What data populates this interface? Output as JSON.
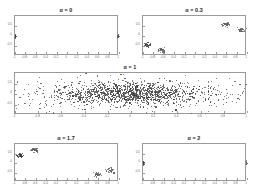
{
  "figure": {
    "background_color": "#ffffff",
    "axis_color": "#9a9a9a",
    "point_color": "#5e5e5e",
    "point_color_dark": "#3c3c3c",
    "title_color": "#1d1d1d"
  },
  "chart_data": [
    {
      "type": "scatter",
      "title": "α = 0",
      "xlabel": "",
      "ylabel": "",
      "xlim": [
        -1.0,
        1.0
      ],
      "ylim": [
        -1.0,
        1.0
      ],
      "grid": false,
      "legend": "none",
      "xticks": [
        -1.0,
        -0.8,
        -0.6,
        -0.4,
        -0.2,
        0.0,
        0.2,
        0.4,
        0.6,
        0.8,
        1.0
      ],
      "xticklabels": [
        "-1",
        "-0.8",
        "-0.6",
        "-0.4",
        "-0.2",
        "0",
        "0.2",
        "0.4",
        "0.6",
        "0.8",
        "1"
      ],
      "yticks": [
        -0.5,
        0.0,
        0.5
      ],
      "yticklabels": [
        "-0.5",
        "0",
        "0.5"
      ],
      "clusters": [
        {
          "cx": -1.0,
          "cy": 0.0,
          "n": 40,
          "sx": 0.012,
          "sy": 0.05
        },
        {
          "cx": 1.0,
          "cy": 0.0,
          "n": 40,
          "sx": 0.012,
          "sy": 0.05
        }
      ]
    },
    {
      "type": "scatter",
      "title": "α = 0.3",
      "xlabel": "",
      "ylabel": "",
      "xlim": [
        -1.0,
        1.0
      ],
      "ylim": [
        -1.0,
        1.0
      ],
      "grid": false,
      "legend": "none",
      "xticks": [
        -1.0,
        -0.8,
        -0.6,
        -0.4,
        -0.2,
        0.0,
        0.2,
        0.4,
        0.6,
        0.8,
        1.0
      ],
      "xticklabels": [
        "-1",
        "-0.8",
        "-0.6",
        "-0.4",
        "-0.2",
        "0",
        "0.2",
        "0.4",
        "0.6",
        "0.8",
        "1"
      ],
      "yticks": [
        -0.5,
        0.0,
        0.5
      ],
      "yticklabels": [
        "-0.5",
        "0",
        "0.5"
      ],
      "clusters": [
        {
          "cx": -0.92,
          "cy": -0.46,
          "n": 34,
          "sx": 0.035,
          "sy": 0.055
        },
        {
          "cx": -0.64,
          "cy": -0.72,
          "n": 34,
          "sx": 0.035,
          "sy": 0.055
        },
        {
          "cx": 0.6,
          "cy": 0.56,
          "n": 34,
          "sx": 0.035,
          "sy": 0.055
        },
        {
          "cx": 0.88,
          "cy": 0.3,
          "n": 34,
          "sx": 0.035,
          "sy": 0.055
        }
      ]
    },
    {
      "type": "scatter",
      "title": "α = 1",
      "xlabel": "",
      "ylabel": "",
      "xlim": [
        -1.0,
        1.0
      ],
      "ylim": [
        -1.0,
        1.0
      ],
      "grid": false,
      "legend": "none",
      "xticks": [
        -1.0,
        -0.8,
        -0.6,
        -0.4,
        -0.2,
        0.0,
        0.2,
        0.4,
        0.6,
        0.8,
        1.0
      ],
      "xticklabels": [
        "-1",
        "-0.8",
        "-0.6",
        "-0.4",
        "-0.2",
        "0",
        "0.2",
        "0.4",
        "0.6",
        "0.8",
        "1"
      ],
      "yticks": [
        -0.5,
        0.0,
        0.5
      ],
      "yticklabels": [
        "-0.5",
        "0",
        "0.5"
      ],
      "clusters": [
        {
          "cx": 0.0,
          "cy": 0.0,
          "n": 900,
          "sx": 0.3,
          "sy": 0.26
        },
        {
          "cx": 0.0,
          "cy": 0.0,
          "n": 420,
          "sx": 0.52,
          "sy": 0.36
        },
        {
          "cx": 0.0,
          "cy": 0.0,
          "n": 140,
          "sx": 0.78,
          "sy": 0.46
        }
      ]
    },
    {
      "type": "scatter",
      "title": "α = 1.7",
      "xlabel": "",
      "ylabel": "",
      "xlim": [
        -1.0,
        1.0
      ],
      "ylim": [
        -1.0,
        1.0
      ],
      "grid": false,
      "legend": "none",
      "xticks": [
        -1.0,
        -0.8,
        -0.6,
        -0.4,
        -0.2,
        0.0,
        0.2,
        0.4,
        0.6,
        0.8,
        1.0
      ],
      "xticklabels": [
        "-1",
        "-0.8",
        "-0.6",
        "-0.4",
        "-0.2",
        "0",
        "0.2",
        "0.4",
        "0.6",
        "0.8",
        "1"
      ],
      "yticks": [
        -0.5,
        0.0,
        0.5
      ],
      "yticklabels": [
        "-0.5",
        "0",
        "0.5"
      ],
      "clusters": [
        {
          "cx": -0.9,
          "cy": 0.4,
          "n": 34,
          "sx": 0.035,
          "sy": 0.055
        },
        {
          "cx": -0.62,
          "cy": 0.66,
          "n": 34,
          "sx": 0.035,
          "sy": 0.055
        },
        {
          "cx": 0.58,
          "cy": -0.62,
          "n": 34,
          "sx": 0.035,
          "sy": 0.055
        },
        {
          "cx": 0.84,
          "cy": -0.4,
          "n": 34,
          "sx": 0.035,
          "sy": 0.055
        }
      ]
    },
    {
      "type": "scatter",
      "title": "α = 2",
      "xlabel": "",
      "ylabel": "",
      "xlim": [
        -1.0,
        1.0
      ],
      "ylim": [
        -1.0,
        1.0
      ],
      "grid": false,
      "legend": "none",
      "xticks": [
        -1.0,
        -0.8,
        -0.6,
        -0.4,
        -0.2,
        0.0,
        0.2,
        0.4,
        0.6,
        0.8,
        1.0
      ],
      "xticklabels": [
        "-1",
        "-0.8",
        "-0.6",
        "-0.4",
        "-0.2",
        "0",
        "0.2",
        "0.4",
        "0.6",
        "0.8",
        "1"
      ],
      "yticks": [
        -0.5,
        0.0,
        0.5
      ],
      "yticklabels": [
        "-0.5",
        "0",
        "0.5"
      ],
      "clusters": [
        {
          "cx": -1.0,
          "cy": 0.0,
          "n": 40,
          "sx": 0.012,
          "sy": 0.05
        },
        {
          "cx": 1.0,
          "cy": 0.0,
          "n": 40,
          "sx": 0.012,
          "sy": 0.05
        }
      ]
    }
  ],
  "layout": {
    "panels": [
      {
        "left": 14,
        "top": 15,
        "width": 104,
        "height": 40,
        "title_top": 7
      },
      {
        "left": 142,
        "top": 15,
        "width": 104,
        "height": 40,
        "title_top": 7
      },
      {
        "left": 14,
        "top": 72,
        "width": 232,
        "height": 42,
        "title_top": 64
      },
      {
        "left": 14,
        "top": 143,
        "width": 104,
        "height": 38,
        "title_top": 135
      },
      {
        "left": 142,
        "top": 143,
        "width": 104,
        "height": 38,
        "title_top": 135
      }
    ]
  }
}
